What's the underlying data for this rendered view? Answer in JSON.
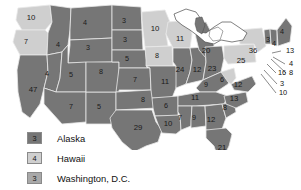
{
  "map": {
    "title": "United States Electoral Votes Map",
    "colors": {
      "dark": "#767676",
      "medium": "#a9a9a9",
      "light": "#cfcfcf",
      "water": "#ffffff",
      "border": "#e9e9e9",
      "outline": "#4a4a4a",
      "text": "#111111"
    },
    "states": [
      {
        "code": "WA",
        "value": "10",
        "shade": "light",
        "x": 31,
        "y": 18
      },
      {
        "code": "OR",
        "value": "7",
        "shade": "light",
        "x": 26,
        "y": 42
      },
      {
        "code": "ID",
        "value": "4",
        "shade": "dark",
        "x": 58,
        "y": 45
      },
      {
        "code": "MT",
        "value": "4",
        "shade": "dark",
        "x": 85,
        "y": 23
      },
      {
        "code": "WY",
        "value": "3",
        "shade": "dark",
        "x": 88,
        "y": 48
      },
      {
        "code": "CA",
        "value": "47",
        "shade": "dark",
        "x": 33,
        "y": 90
      },
      {
        "code": "NV",
        "value": "4",
        "shade": "dark",
        "x": 47,
        "y": 74
      },
      {
        "code": "UT",
        "value": "5",
        "shade": "dark",
        "x": 71,
        "y": 75
      },
      {
        "code": "AZ",
        "value": "7",
        "shade": "dark",
        "x": 71,
        "y": 107
      },
      {
        "code": "NM",
        "value": "5",
        "shade": "dark",
        "x": 99,
        "y": 107
      },
      {
        "code": "CO",
        "value": "8",
        "shade": "dark",
        "x": 101,
        "y": 72
      },
      {
        "code": "ND",
        "value": "3",
        "shade": "dark",
        "x": 124,
        "y": 21
      },
      {
        "code": "SD",
        "value": "3",
        "shade": "dark",
        "x": 125,
        "y": 40
      },
      {
        "code": "NE",
        "value": "5",
        "shade": "dark",
        "x": 127,
        "y": 59
      },
      {
        "code": "KS",
        "value": "7",
        "shade": "dark",
        "x": 135,
        "y": 80
      },
      {
        "code": "OK",
        "value": "8",
        "shade": "dark",
        "x": 143,
        "y": 100
      },
      {
        "code": "TX",
        "value": "29",
        "shade": "dark",
        "x": 138,
        "y": 128
      },
      {
        "code": "MN",
        "value": "10",
        "shade": "light",
        "x": 155,
        "y": 29
      },
      {
        "code": "IA",
        "value": "8",
        "shade": "light",
        "x": 157,
        "y": 56
      },
      {
        "code": "MO",
        "value": "11",
        "shade": "dark",
        "x": 165,
        "y": 82
      },
      {
        "code": "AR",
        "value": "6",
        "shade": "dark",
        "x": 166,
        "y": 106
      },
      {
        "code": "LA",
        "value": "10",
        "shade": "dark",
        "x": 168,
        "y": 124
      },
      {
        "code": "WI",
        "value": "11",
        "shade": "light",
        "x": 180,
        "y": 39
      },
      {
        "code": "IL",
        "value": "24",
        "shade": "dark",
        "x": 180,
        "y": 70
      },
      {
        "code": "IN",
        "value": "12",
        "shade": "dark",
        "x": 197,
        "y": 70
      },
      {
        "code": "MI",
        "value": "20",
        "shade": "dark",
        "x": 206,
        "y": 51
      },
      {
        "code": "OH",
        "value": "23",
        "shade": "dark",
        "x": 212,
        "y": 69
      },
      {
        "code": "KY",
        "value": "9",
        "shade": "dark",
        "x": 206,
        "y": 85
      },
      {
        "code": "TN",
        "value": "11",
        "shade": "dark",
        "x": 195,
        "y": 98
      },
      {
        "code": "MS",
        "value": "7",
        "shade": "dark",
        "x": 180,
        "y": 118
      },
      {
        "code": "AL",
        "value": "9",
        "shade": "dark",
        "x": 194,
        "y": 118
      },
      {
        "code": "GA",
        "value": "12",
        "shade": "dark",
        "x": 211,
        "y": 120
      },
      {
        "code": "FL",
        "value": "21",
        "shade": "dark",
        "x": 222,
        "y": 148
      },
      {
        "code": "SC",
        "value": "8",
        "shade": "dark",
        "x": 225,
        "y": 108
      },
      {
        "code": "NC",
        "value": "13",
        "shade": "dark",
        "x": 234,
        "y": 99
      },
      {
        "code": "WV",
        "value": "6",
        "shade": "light",
        "x": 222,
        "y": 80
      },
      {
        "code": "VA",
        "value": "12",
        "shade": "dark",
        "x": 238,
        "y": 85
      },
      {
        "code": "PA",
        "value": "25",
        "shade": "light",
        "x": 241,
        "y": 61
      },
      {
        "code": "NY",
        "value": "36",
        "shade": "light",
        "x": 253,
        "y": 51
      },
      {
        "code": "VT",
        "value": "3",
        "shade": "dark",
        "x": 268,
        "y": 40
      },
      {
        "code": "NH",
        "value": "4",
        "shade": "dark",
        "x": 274,
        "y": 44
      },
      {
        "code": "ME",
        "value": "4",
        "shade": "dark",
        "x": 282,
        "y": 32
      }
    ],
    "callouts": [
      {
        "code": "MA",
        "value": "13",
        "tx": 286,
        "ty": 51,
        "lx": 281,
        "ly": 51,
        "px": 272,
        "py": 53
      },
      {
        "code": "RI",
        "value": "4",
        "tx": 289,
        "ty": 64,
        "lx": 285,
        "ly": 64,
        "px": 273,
        "py": 57
      },
      {
        "code": "CT",
        "value": "8",
        "tx": 289,
        "ty": 73,
        "lx": 286,
        "ly": 73,
        "px": 271,
        "py": 59
      },
      {
        "code": "NJ",
        "value": "16",
        "tx": 278,
        "ty": 73,
        "lx": 276,
        "ly": 73,
        "px": 267,
        "py": 64
      },
      {
        "code": "DE",
        "value": "3",
        "tx": 280,
        "ty": 84,
        "lx": 277,
        "ly": 84,
        "px": 264,
        "py": 70
      },
      {
        "code": "MD",
        "value": "10",
        "tx": 279,
        "ty": 93,
        "lx": 276,
        "ly": 93,
        "px": 261,
        "py": 74
      }
    ]
  },
  "legend": {
    "rows": [
      {
        "value": "3",
        "label": "Alaska",
        "shade": "dark"
      },
      {
        "value": "4",
        "label": "Hawaii",
        "shade": "light"
      },
      {
        "value": "3",
        "label": "Washington, D.C.",
        "shade": "medium"
      }
    ]
  }
}
